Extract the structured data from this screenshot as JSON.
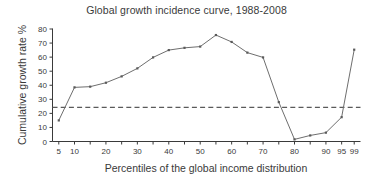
{
  "chart_data": {
    "type": "line",
    "title": "Global growth incidence curve, 1988-2008",
    "xlabel": "Percentiles of the global income distribution",
    "ylabel": "Cumulative growth rate %",
    "x": [
      5,
      10,
      15,
      20,
      25,
      30,
      35,
      40,
      45,
      50,
      55,
      60,
      65,
      70,
      75,
      80,
      85,
      90,
      95,
      99
    ],
    "values": [
      15.0,
      38.5,
      39.0,
      41.8,
      46.3,
      52.0,
      59.8,
      65.0,
      66.6,
      67.5,
      75.7,
      70.8,
      63.2,
      59.8,
      28.0,
      1.5,
      4.3,
      6.3,
      17.3,
      65.3
    ],
    "series": [
      {
        "name": "Cumulative growth rate",
        "values": [
          15.0,
          38.5,
          39.0,
          41.8,
          46.3,
          52.0,
          59.8,
          65.0,
          66.6,
          67.5,
          75.7,
          70.8,
          63.2,
          59.8,
          28.0,
          1.5,
          4.3,
          6.3,
          17.3,
          65.3
        ]
      }
    ],
    "reference_line": {
      "value": 24.3,
      "style": "dashed",
      "orientation": "horizontal"
    },
    "xtick_positions": [
      5,
      10,
      15,
      20,
      25,
      30,
      35,
      40,
      45,
      50,
      55,
      60,
      65,
      70,
      75,
      80,
      85,
      90,
      95,
      99
    ],
    "xtick_labels": [
      "5",
      "10",
      "",
      "20",
      "",
      "30",
      "",
      "40",
      "",
      "50",
      "",
      "60",
      "",
      "70",
      "",
      "80",
      "",
      "90",
      "95",
      "99"
    ],
    "ytick_values": [
      0,
      10,
      20,
      30,
      40,
      50,
      60,
      70,
      80
    ],
    "ytick_labels": [
      "0",
      "10",
      "20",
      "30",
      "40",
      "50",
      "60",
      "70",
      "80"
    ],
    "xlim": [
      3,
      101
    ],
    "ylim": [
      0,
      80
    ],
    "grid": false,
    "legend": null,
    "colors": {
      "line": "#6e6e6e",
      "marker": "#5a5a5a",
      "reference_line": "#5a5a5a",
      "axis": "#3a3a3a",
      "background": "#ffffff",
      "text": "#3a3a3a"
    }
  }
}
